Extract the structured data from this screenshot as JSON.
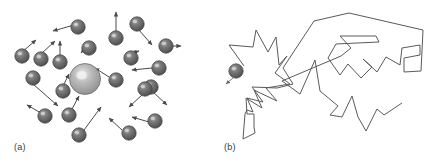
{
  "figure": {
    "width": 435,
    "height": 168,
    "background": "#ffffff",
    "panels": [
      {
        "id": "a",
        "label": "(a)",
        "label_x": 14,
        "label_y": 150,
        "caption_meaning": "central large particle surrounded by smaller particles with velocity arrows (Brownian collisions)"
      },
      {
        "id": "b",
        "label": "(b)",
        "label_x": 224,
        "label_y": 150,
        "caption_meaning": "resulting random-walk zigzag trajectory of the particle"
      }
    ],
    "colors": {
      "sphere_fill_dark": "#4c4c4c",
      "sphere_fill_mid": "#6f6f6f",
      "sphere_highlight": "#c9c9c9",
      "sphere_stroke": "#3d3d3d",
      "big_sphere_fill": "#9a9a9a",
      "big_sphere_highlight": "#e3e3e3",
      "arrow_color": "#4a4a4a",
      "path_color": "#5a5a5a",
      "label_color": "#3a3a3a"
    }
  },
  "panel_a": {
    "big_sphere": {
      "cx": 85,
      "cy": 79,
      "r": 15.5
    },
    "small_sphere_radius": 7.2,
    "small_spheres": [
      {
        "cx": 22,
        "cy": 56
      },
      {
        "cx": 41,
        "cy": 59
      },
      {
        "cx": 60,
        "cy": 62
      },
      {
        "cx": 78,
        "cy": 27
      },
      {
        "cx": 89,
        "cy": 48
      },
      {
        "cx": 116,
        "cy": 38
      },
      {
        "cx": 137,
        "cy": 24
      },
      {
        "cx": 166,
        "cy": 46
      },
      {
        "cx": 131,
        "cy": 58
      },
      {
        "cx": 159,
        "cy": 68
      },
      {
        "cx": 116,
        "cy": 80
      },
      {
        "cx": 151,
        "cy": 87
      },
      {
        "cx": 33,
        "cy": 78
      },
      {
        "cx": 63,
        "cy": 91
      },
      {
        "cx": 45,
        "cy": 116
      },
      {
        "cx": 69,
        "cy": 115
      },
      {
        "cx": 79,
        "cy": 135
      },
      {
        "cx": 145,
        "cy": 89
      },
      {
        "cx": 155,
        "cy": 121
      },
      {
        "cx": 129,
        "cy": 133
      }
    ],
    "arrows": [
      {
        "x1": 22,
        "y1": 52,
        "x2": 36,
        "y2": 40
      },
      {
        "x1": 41,
        "y1": 54,
        "x2": 55,
        "y2": 41
      },
      {
        "x1": 60,
        "y1": 57,
        "x2": 60,
        "y2": 41
      },
      {
        "x1": 74,
        "y1": 25,
        "x2": 53,
        "y2": 31
      },
      {
        "x1": 89,
        "y1": 44,
        "x2": 81,
        "y2": 53
      },
      {
        "x1": 116,
        "y1": 31,
        "x2": 116,
        "y2": 12
      },
      {
        "x1": 139,
        "y1": 30,
        "x2": 152,
        "y2": 45
      },
      {
        "x1": 172,
        "y1": 46,
        "x2": 181,
        "y2": 46
      },
      {
        "x1": 124,
        "y1": 56,
        "x2": 139,
        "y2": 51
      },
      {
        "x1": 152,
        "y1": 68,
        "x2": 132,
        "y2": 70
      },
      {
        "x1": 109,
        "y1": 77,
        "x2": 95,
        "y2": 68
      },
      {
        "x1": 153,
        "y1": 92,
        "x2": 167,
        "y2": 105
      },
      {
        "x1": 33,
        "y1": 84,
        "x2": 58,
        "y2": 106
      },
      {
        "x1": 63,
        "y1": 86,
        "x2": 69,
        "y2": 74
      },
      {
        "x1": 41,
        "y1": 113,
        "x2": 27,
        "y2": 105
      },
      {
        "x1": 72,
        "y1": 109,
        "x2": 79,
        "y2": 96
      },
      {
        "x1": 84,
        "y1": 130,
        "x2": 101,
        "y2": 107
      },
      {
        "x1": 143,
        "y1": 94,
        "x2": 129,
        "y2": 107
      },
      {
        "x1": 149,
        "y1": 122,
        "x2": 132,
        "y2": 117
      },
      {
        "x1": 122,
        "y1": 130,
        "x2": 109,
        "y2": 118
      }
    ]
  },
  "panel_b": {
    "start_sphere": {
      "cx": 236,
      "cy": 71,
      "r": 7.2
    },
    "start_arrow": {
      "x1": 234,
      "y1": 77,
      "x2": 226,
      "y2": 84
    },
    "path_points": "244,66 229,45 253,47 256,30 268,52 276,37 279,65 287,56 275,73 290,84 266,88 277,101 254,90 262,108 246,98 247,114 254,114 254,127 255,133 243,139 245,114 247,110 253,112 247,98 263,102 252,87 277,88 293,84 283,68 314,21 349,13 423,30 421,71 404,72 404,58 420,55 420,45 402,48 400,65 386,57 377,72 363,59 372,67 361,78 348,64 340,75 328,58 336,44 379,42 376,36 340,36 351,48 341,56 282,81 300,94 315,60 320,91 338,106 330,115 342,117 352,96 358,117 366,131 377,109 384,115 402,103"
  }
}
